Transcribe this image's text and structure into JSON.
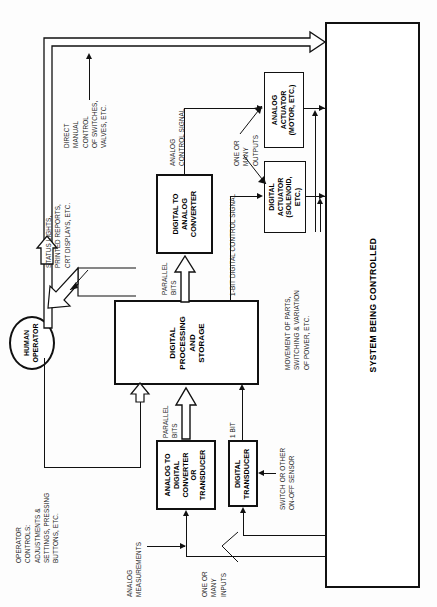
{
  "diagram": {
    "orientation": "rotated-90-ccw",
    "line_color": "#111111",
    "box_fill": "#ffffff",
    "text_color": "#000000"
  },
  "blocks": {
    "system": {
      "label": "SYSTEM BEING CONTROLLED"
    },
    "human_operator": {
      "label": "HUMAN\nOPERATOR",
      "line1": "HUMAN",
      "line2": "OPERATOR"
    },
    "digital_processing": {
      "line1": "DIGITAL",
      "line2": "PROCESSING",
      "line3": "AND",
      "line4": "STORAGE"
    },
    "dac": {
      "line1": "DIGITAL TO",
      "line2": "ANALOG",
      "line3": "CONVERTER"
    },
    "analog_actuator": {
      "line1": "ANALOG",
      "line2": "ACTUATOR",
      "line3": "(MOTOR, ETC.)"
    },
    "digital_actuator": {
      "line1": "DIGITAL",
      "line2": "ACTUATOR",
      "line3": "(SOLENOID,",
      "line4": "ETC.)"
    },
    "adc": {
      "line1": "ANALOG TO",
      "line2": "DIGITAL",
      "line3": "CONVERTER",
      "line4": "OR",
      "line5": "TRANSDUCER"
    },
    "digital_transducer": {
      "line1": "DIGITAL",
      "line2": "TRANSDUCER"
    }
  },
  "annotations": {
    "direct_manual_control": "DIRECT\nMANUAL\nCONTROL\nOF SWITCHES,\nVALVES, ETC.",
    "status_lights": "STATUS LIGHTS,\nPRINTED REPORTS,\nCRT DISPLAYS, ETC.",
    "operator_controls": "OPERATOR\nCONTROLS:\nADJUSTMENTS &\nSETTINGS, PRESSING\nBUTTONS, ETC.",
    "analog_control_signal": "ANALOG\nCONTROL SIGNAL",
    "one_or_many_outputs": "ONE OR\nMANY\nOUTPUTS",
    "one_bit_digital_control_signal": "1-BIT DIGITAL CONTROL SIGNAL",
    "movement_of_parts": "MOVEMENT OF PARTS,\nSWITCHING & VARIATION\nOF POWER, ETC.",
    "parallel_bits_out": "PARALLEL\nBITS",
    "parallel_bits_in": "PARALLEL\nBITS",
    "one_bit": "1 BIT",
    "switch_or_other": "SWITCH OR OTHER\nON-OFF SENSOR",
    "analog_measurements": "ANALOG\nMEASUREMENTS",
    "one_or_many_inputs": "ONE OR\nMANY\nINPUTS"
  }
}
